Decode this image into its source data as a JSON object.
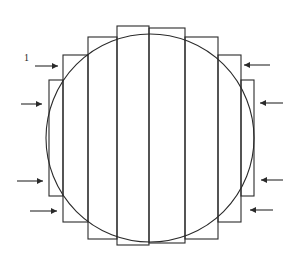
{
  "diagram": {
    "label": "1",
    "colors": {
      "stroke": "#2a2a2a",
      "background": "#ffffff"
    },
    "circle": {
      "cx": 150,
      "cy": 138,
      "r": 104
    },
    "strips": [
      {
        "x1": 49,
        "x2": 63,
        "top": 80,
        "bottom": 196
      },
      {
        "x1": 63,
        "x2": 88,
        "top": 55,
        "bottom": 222
      },
      {
        "x1": 88,
        "x2": 117,
        "top": 37,
        "bottom": 239
      },
      {
        "x1": 117,
        "x2": 149,
        "top": 26,
        "bottom": 245
      },
      {
        "x1": 149,
        "x2": 185,
        "top": 28,
        "bottom": 243
      },
      {
        "x1": 185,
        "x2": 218,
        "top": 37,
        "bottom": 239
      },
      {
        "x1": 218,
        "x2": 241,
        "top": 55,
        "bottom": 222
      },
      {
        "x1": 241,
        "x2": 254,
        "top": 80,
        "bottom": 196
      }
    ],
    "arrows_left": [
      {
        "x1": 35,
        "x2": 58,
        "y": 66
      },
      {
        "x1": 21,
        "x2": 42,
        "y": 104
      },
      {
        "x1": 17,
        "x2": 43,
        "y": 181
      },
      {
        "x1": 30,
        "x2": 57,
        "y": 211
      }
    ],
    "arrows_right": [
      {
        "x1": 270,
        "x2": 244,
        "y": 65
      },
      {
        "x1": 283,
        "x2": 260,
        "y": 103
      },
      {
        "x1": 283,
        "x2": 261,
        "y": 180
      },
      {
        "x1": 273,
        "x2": 250,
        "y": 210
      }
    ]
  }
}
